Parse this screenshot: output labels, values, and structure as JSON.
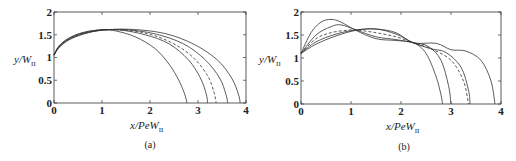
{
  "figure": {
    "panels": [
      {
        "id": "a",
        "caption": "(a)",
        "xlabel_main": "x/PeW",
        "xlabel_sub": "II",
        "ylabel_main": "y/W",
        "ylabel_sub": "II",
        "xticks": [
          "0",
          "1",
          "2",
          "3",
          "4"
        ],
        "yticks": [
          "0",
          "0.5",
          "1",
          "1.5",
          "2"
        ]
      },
      {
        "id": "b",
        "caption": "(b)",
        "xlabel_main": "x/PeW",
        "xlabel_sub": "II",
        "ylabel_main": "y/W",
        "ylabel_sub": "II",
        "xticks": [
          "0",
          "1",
          "2",
          "3",
          "4"
        ],
        "yticks": [
          "0",
          "0.5",
          "1",
          "1.5",
          "2"
        ]
      }
    ]
  },
  "chart_data": [
    {
      "type": "line",
      "title": "(a)",
      "xlabel": "x/PeW_II",
      "ylabel": "y/W_II",
      "xlim": [
        0,
        4
      ],
      "ylim": [
        0,
        2
      ],
      "grid": false,
      "legend": null,
      "series": [
        {
          "name": "curve-1",
          "style": "solid",
          "x": [
            0,
            0.1,
            0.3,
            0.6,
            1.0,
            1.3,
            1.7,
            2.1,
            2.4,
            2.6,
            2.72,
            2.77
          ],
          "y": [
            1.05,
            1.25,
            1.42,
            1.55,
            1.61,
            1.58,
            1.45,
            1.2,
            0.85,
            0.5,
            0.2,
            0
          ]
        },
        {
          "name": "curve-2",
          "style": "solid",
          "x": [
            0,
            0.1,
            0.3,
            0.6,
            1.0,
            1.4,
            1.9,
            2.4,
            2.8,
            3.05,
            3.17,
            3.2
          ],
          "y": [
            1.05,
            1.24,
            1.41,
            1.54,
            1.61,
            1.6,
            1.5,
            1.3,
            0.95,
            0.55,
            0.2,
            0
          ]
        },
        {
          "name": "curve-3 (dashed)",
          "style": "dashed",
          "x": [
            0,
            0.1,
            0.3,
            0.6,
            1.0,
            1.5,
            2.0,
            2.5,
            2.9,
            3.2,
            3.33,
            3.38
          ],
          "y": [
            1.05,
            1.23,
            1.4,
            1.53,
            1.6,
            1.6,
            1.51,
            1.3,
            1.0,
            0.6,
            0.25,
            0
          ]
        },
        {
          "name": "curve-4",
          "style": "solid",
          "x": [
            0,
            0.1,
            0.3,
            0.6,
            1.0,
            1.5,
            2.1,
            2.7,
            3.15,
            3.45,
            3.58,
            3.62
          ],
          "y": [
            1.05,
            1.22,
            1.39,
            1.52,
            1.6,
            1.61,
            1.52,
            1.3,
            0.95,
            0.55,
            0.2,
            0
          ]
        },
        {
          "name": "curve-5",
          "style": "solid",
          "x": [
            0,
            0.1,
            0.3,
            0.6,
            1.0,
            1.6,
            2.3,
            2.9,
            3.4,
            3.7,
            3.84,
            3.88
          ],
          "y": [
            1.05,
            1.21,
            1.38,
            1.51,
            1.6,
            1.62,
            1.53,
            1.3,
            0.95,
            0.55,
            0.2,
            0
          ]
        }
      ]
    },
    {
      "type": "line",
      "title": "(b)",
      "xlabel": "x/PeW_II",
      "ylabel": "y/W_II",
      "xlim": [
        0,
        4
      ],
      "ylim": [
        0,
        2
      ],
      "grid": false,
      "legend": null,
      "series": [
        {
          "name": "curve-1",
          "style": "solid",
          "x": [
            0,
            0.2,
            0.4,
            0.6,
            0.8,
            1.1,
            1.5,
            1.9,
            2.25,
            2.5,
            2.7,
            2.8,
            2.83
          ],
          "y": [
            1.1,
            1.55,
            1.78,
            1.84,
            1.78,
            1.6,
            1.42,
            1.38,
            1.33,
            1.1,
            0.6,
            0.2,
            0
          ]
        },
        {
          "name": "curve-2",
          "style": "solid",
          "x": [
            0,
            0.3,
            0.6,
            0.8,
            1.1,
            1.5,
            1.9,
            2.25,
            2.55,
            2.8,
            2.95,
            3.0
          ],
          "y": [
            1.1,
            1.5,
            1.68,
            1.72,
            1.61,
            1.46,
            1.4,
            1.33,
            1.25,
            0.95,
            0.4,
            0
          ]
        },
        {
          "name": "curve-3 (dashed)",
          "style": "dashed",
          "x": [
            0,
            0.3,
            0.6,
            0.9,
            1.1,
            1.5,
            1.9,
            2.25,
            2.6,
            3.0,
            3.25,
            3.35
          ],
          "y": [
            1.1,
            1.42,
            1.55,
            1.6,
            1.61,
            1.55,
            1.46,
            1.33,
            1.2,
            0.95,
            0.5,
            0
          ]
        },
        {
          "name": "curve-4",
          "style": "solid",
          "x": [
            0,
            0.3,
            0.7,
            1.1,
            1.5,
            1.9,
            2.25,
            2.6,
            2.9,
            3.2,
            3.35,
            3.38
          ],
          "y": [
            1.1,
            1.35,
            1.52,
            1.61,
            1.63,
            1.52,
            1.33,
            1.2,
            1.12,
            0.8,
            0.3,
            0
          ]
        },
        {
          "name": "curve-5",
          "style": "solid",
          "x": [
            0,
            0.3,
            0.7,
            1.1,
            1.5,
            1.9,
            2.25,
            2.7,
            3.0,
            3.3,
            3.6,
            3.8,
            3.88
          ],
          "y": [
            1.1,
            1.3,
            1.48,
            1.6,
            1.63,
            1.55,
            1.33,
            1.32,
            1.18,
            1.15,
            0.95,
            0.5,
            0
          ]
        }
      ]
    }
  ]
}
